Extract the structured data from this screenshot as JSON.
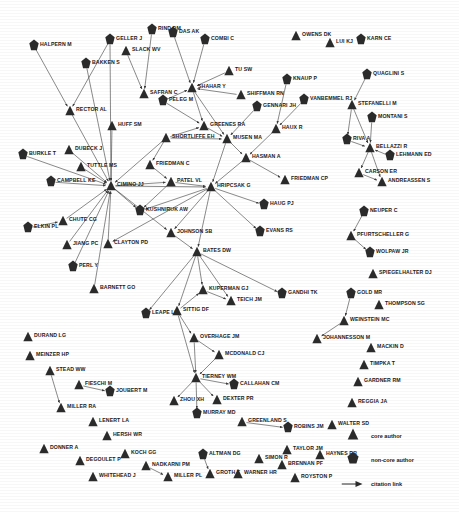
{
  "figure": {
    "type": "citation-network-diagram",
    "background": "#ffffff",
    "node_color": "#2b2b2b",
    "edge_color": "#3a3a3a",
    "label_color": "#1a1a1a"
  },
  "legend": {
    "items": [
      {
        "glyph": "triangle",
        "label": "core author",
        "icon_name": "triangle-core-author-icon"
      },
      {
        "glyph": "pentagon",
        "label": "non-core author",
        "icon_name": "pentagon-non-core-author-icon"
      },
      {
        "glyph": "arrow",
        "label": "citation link",
        "icon_name": "arrow-citation-link-icon"
      }
    ]
  },
  "chart_data": {
    "type": "scatter",
    "title": "",
    "xlabel": "",
    "ylabel": "",
    "grid": false,
    "legend_position": "bottom-right",
    "node_types": [
      "core",
      "non-core"
    ],
    "nodes": [
      {
        "id": "HALPERN M",
        "label": "HALPERN M",
        "type": "non-core",
        "x": 34,
        "y": 46
      },
      {
        "id": "BAKKEN S",
        "label": "BAKKEN S",
        "type": "non-core",
        "x": 86,
        "y": 64
      },
      {
        "id": "GELLER J",
        "label": "GELLER J",
        "type": "non-core",
        "x": 110,
        "y": 40
      },
      {
        "id": "SLACK WV",
        "label": "SLACK WV",
        "type": "core",
        "x": 126,
        "y": 51
      },
      {
        "id": "RIND DM",
        "label": "RIND DM",
        "type": "non-core",
        "x": 152,
        "y": 30
      },
      {
        "id": "DAS AK",
        "label": "DAS AK",
        "type": "non-core",
        "x": 173,
        "y": 33
      },
      {
        "id": "COMBI C",
        "label": "COMBI C",
        "type": "non-core",
        "x": 205,
        "y": 40
      },
      {
        "id": "OWENS DK",
        "label": "OWENS DK",
        "type": "core",
        "x": 296,
        "y": 36
      },
      {
        "id": "LUI KJ",
        "label": "LUI KJ",
        "type": "core",
        "x": 330,
        "y": 43
      },
      {
        "id": "KARN CE",
        "label": "KARN CE",
        "type": "non-core",
        "x": 361,
        "y": 40
      },
      {
        "id": "TU SW",
        "label": "TU SW",
        "type": "core",
        "x": 229,
        "y": 71
      },
      {
        "id": "KNAUP P",
        "label": "KNAUP P",
        "type": "non-core",
        "x": 287,
        "y": 80
      },
      {
        "id": "QUAGLINI S",
        "label": "QUAGLINI S",
        "type": "non-core",
        "x": 367,
        "y": 75
      },
      {
        "id": "SAFRAN C",
        "label": "SAFRAN C",
        "type": "core",
        "x": 144,
        "y": 94
      },
      {
        "id": "SHAHAR Y",
        "label": "SHAHAR Y",
        "type": "core",
        "x": 192,
        "y": 88
      },
      {
        "id": "SHIFFMAN RN",
        "label": "SHIFFMAN RN",
        "type": "core",
        "x": 241,
        "y": 95
      },
      {
        "id": "PELEG M",
        "label": "PELEG M",
        "type": "non-core",
        "x": 163,
        "y": 101
      },
      {
        "id": "GENNARI JH",
        "label": "GENNARI JH",
        "type": "non-core",
        "x": 257,
        "y": 107
      },
      {
        "id": "VANBEMMEL RJ",
        "label": "VANBEMMEL RJ",
        "type": "non-core",
        "x": 304,
        "y": 100
      },
      {
        "id": "STEFANELLI M",
        "label": "STEFANELLI M",
        "type": "core",
        "x": 352,
        "y": 105
      },
      {
        "id": "RECTOR AL",
        "label": "RECTOR AL",
        "type": "core",
        "x": 70,
        "y": 111
      },
      {
        "id": "HUFF SM",
        "label": "HUFF SM",
        "type": "core",
        "x": 112,
        "y": 126
      },
      {
        "id": "SHORTLIFFE EH",
        "label": "SHORTLIFFE EH",
        "type": "core",
        "x": 166,
        "y": 138
      },
      {
        "id": "GREENES RA",
        "label": "GREENES RA",
        "type": "core",
        "x": 204,
        "y": 126
      },
      {
        "id": "MUSEN MA",
        "label": "MUSEN MA",
        "type": "core",
        "x": 227,
        "y": 139
      },
      {
        "id": "HAUX R",
        "label": "HAUX R",
        "type": "core",
        "x": 276,
        "y": 129
      },
      {
        "id": "MONTANI S",
        "label": "MONTANI S",
        "type": "non-core",
        "x": 372,
        "y": 118
      },
      {
        "id": "RIVA A",
        "label": "RIVA A",
        "type": "non-core",
        "x": 347,
        "y": 140
      },
      {
        "id": "BELLAZZI R",
        "label": "BELLAZZI R",
        "type": "core",
        "x": 370,
        "y": 148
      },
      {
        "id": "LEHMANN ED",
        "label": "LEHMANN ED",
        "type": "non-core",
        "x": 390,
        "y": 156
      },
      {
        "id": "CARSON ER",
        "label": "CARSON ER",
        "type": "core",
        "x": 359,
        "y": 173
      },
      {
        "id": "ANDREASSEN S",
        "label": "ANDREASSEN S",
        "type": "core",
        "x": 382,
        "y": 182
      },
      {
        "id": "BURKLE T",
        "label": "BURKLE T",
        "type": "non-core",
        "x": 23,
        "y": 155
      },
      {
        "id": "DUBECK J",
        "label": "DUBECK J",
        "type": "core",
        "x": 69,
        "y": 150
      },
      {
        "id": "TUTTLE MS",
        "label": "TUTTLE MS",
        "type": "core",
        "x": 81,
        "y": 167
      },
      {
        "id": "HASMAN A",
        "label": "HASMAN A",
        "type": "core",
        "x": 246,
        "y": 158
      },
      {
        "id": "FRIEDMAN C",
        "label": "FRIEDMAN C",
        "type": "core",
        "x": 150,
        "y": 165
      },
      {
        "id": "CAMPBELL KE",
        "label": "CAMPBELL KE",
        "type": "non-core",
        "x": 51,
        "y": 182
      },
      {
        "id": "CIMINO JJ",
        "label": "CIMINO JJ",
        "type": "core",
        "x": 111,
        "y": 186
      },
      {
        "id": "PATEL VL",
        "label": "PATEL VL",
        "type": "core",
        "x": 171,
        "y": 182
      },
      {
        "id": "HRIPCSAK G",
        "label": "HRIPCSAK G",
        "type": "core",
        "x": 211,
        "y": 187
      },
      {
        "id": "FRIEDMAN CP",
        "label": "FRIEDMAN CP",
        "type": "core",
        "x": 285,
        "y": 180
      },
      {
        "id": "HAUG PJ",
        "label": "HAUG PJ",
        "type": "non-core",
        "x": 264,
        "y": 205
      },
      {
        "id": "NEUPER C",
        "label": "NEUPER C",
        "type": "non-core",
        "x": 364,
        "y": 212
      },
      {
        "id": "ELKIN PL",
        "label": "ELKIN PL",
        "type": "non-core",
        "x": 28,
        "y": 228
      },
      {
        "id": "CHUTE CG",
        "label": "CHUTE CG",
        "type": "core",
        "x": 63,
        "y": 221
      },
      {
        "id": "KUSHNIRUK AW",
        "label": "KUSHNIRUK AW",
        "type": "non-core",
        "x": 140,
        "y": 211
      },
      {
        "id": "JOHNSON SB",
        "label": "JOHNSON SB",
        "type": "core",
        "x": 171,
        "y": 233
      },
      {
        "id": "EVANS RS",
        "label": "EVANS RS",
        "type": "non-core",
        "x": 260,
        "y": 232
      },
      {
        "id": "PFURTSCHELLER G",
        "label": "PFURTSCHELLER G",
        "type": "core",
        "x": 351,
        "y": 236
      },
      {
        "id": "JIANG PC",
        "label": "JIANG PC",
        "type": "core",
        "x": 67,
        "y": 245
      },
      {
        "id": "CLAYTON PD",
        "label": "CLAYTON PD",
        "type": "core",
        "x": 108,
        "y": 244
      },
      {
        "id": "BATES DW",
        "label": "BATES DW",
        "type": "core",
        "x": 197,
        "y": 252
      },
      {
        "id": "WOLPAW JR",
        "label": "WOLPAW JR",
        "type": "non-core",
        "x": 370,
        "y": 253
      },
      {
        "id": "PERL Y",
        "label": "PERL Y",
        "type": "non-core",
        "x": 73,
        "y": 267
      },
      {
        "id": "SPIEGELHALTER DJ",
        "label": "SPIEGELHALTER DJ",
        "type": "core",
        "x": 373,
        "y": 274
      },
      {
        "id": "BARNETT GO",
        "label": "BARNETT GO",
        "type": "core",
        "x": 94,
        "y": 289
      },
      {
        "id": "KUPERMAN GJ",
        "label": "KUPERMAN GJ",
        "type": "core",
        "x": 203,
        "y": 290
      },
      {
        "id": "TEICH JM",
        "label": "TEICH JM",
        "type": "core",
        "x": 231,
        "y": 301
      },
      {
        "id": "GANDHI TK",
        "label": "GANDHI TK",
        "type": "non-core",
        "x": 282,
        "y": 294
      },
      {
        "id": "GOLD MR",
        "label": "GOLD MR",
        "type": "non-core",
        "x": 351,
        "y": 294
      },
      {
        "id": "THOMPSON SG",
        "label": "THOMPSON SG",
        "type": "core",
        "x": 379,
        "y": 305
      },
      {
        "id": "LEAPE LL",
        "label": "LEAPE LL",
        "type": "non-core",
        "x": 146,
        "y": 314
      },
      {
        "id": "SITTIG DF",
        "label": "SITTIG DF",
        "type": "core",
        "x": 177,
        "y": 311
      },
      {
        "id": "WEINSTEIN MC",
        "label": "WEINSTEIN MC",
        "type": "core",
        "x": 344,
        "y": 321
      },
      {
        "id": "DURAND LG",
        "label": "DURAND LG",
        "type": "core",
        "x": 28,
        "y": 337
      },
      {
        "id": "MEINZER HP",
        "label": "MEINZER HP",
        "type": "core",
        "x": 30,
        "y": 356
      },
      {
        "id": "OVERHAGE JM",
        "label": "OVERHAGE JM",
        "type": "core",
        "x": 194,
        "y": 338
      },
      {
        "id": "JOHANNESSON M",
        "label": "JOHANNESSON M",
        "type": "core",
        "x": 317,
        "y": 339
      },
      {
        "id": "MACKIN D",
        "label": "MACKIN D",
        "type": "core",
        "x": 371,
        "y": 348
      },
      {
        "id": "MCDONALD CJ",
        "label": "MCDONALD CJ",
        "type": "core",
        "x": 219,
        "y": 355
      },
      {
        "id": "TIMPKA T",
        "label": "TIMPKA T",
        "type": "core",
        "x": 364,
        "y": 365
      },
      {
        "id": "STEAD WW",
        "label": "STEAD WW",
        "type": "core",
        "x": 50,
        "y": 371
      },
      {
        "id": "FIESCHI M",
        "label": "FIESCHI M",
        "type": "core",
        "x": 79,
        "y": 385
      },
      {
        "id": "JOUBERT M",
        "label": "JOUBERT M",
        "type": "non-core",
        "x": 110,
        "y": 392
      },
      {
        "id": "TIERNEY WM",
        "label": "TIERNEY WM",
        "type": "core",
        "x": 196,
        "y": 378
      },
      {
        "id": "CALLAHAN CM",
        "label": "CALLAHAN CM",
        "type": "non-core",
        "x": 234,
        "y": 385
      },
      {
        "id": "GARDNER RM",
        "label": "GARDNER RM",
        "type": "core",
        "x": 358,
        "y": 382
      },
      {
        "id": "MILLER RA",
        "label": "MILLER RA",
        "type": "core",
        "x": 61,
        "y": 408
      },
      {
        "id": "ZHOU XH",
        "label": "ZHOU XH",
        "type": "core",
        "x": 174,
        "y": 401
      },
      {
        "id": "DEXTER PR",
        "label": "DEXTER PR",
        "type": "core",
        "x": 217,
        "y": 400
      },
      {
        "id": "MURRAY MD",
        "label": "MURRAY MD",
        "type": "non-core",
        "x": 197,
        "y": 414
      },
      {
        "id": "REGGIA JA",
        "label": "REGGIA JA",
        "type": "core",
        "x": 352,
        "y": 403
      },
      {
        "id": "LENERT LA",
        "label": "LENERT LA",
        "type": "core",
        "x": 93,
        "y": 422
      },
      {
        "id": "GREENLAND S",
        "label": "GREENLAND S",
        "type": "core",
        "x": 242,
        "y": 422
      },
      {
        "id": "ROBINS JM",
        "label": "ROBINS JM",
        "type": "non-core",
        "x": 288,
        "y": 428
      },
      {
        "id": "WALTER SD",
        "label": "WALTER SD",
        "type": "core",
        "x": 332,
        "y": 425
      },
      {
        "id": "HERSH WR",
        "label": "HERSH WR",
        "type": "core",
        "x": 107,
        "y": 436
      },
      {
        "id": "DONNER A",
        "label": "DONNER A",
        "type": "core",
        "x": 44,
        "y": 449
      },
      {
        "id": "DEGOULET P",
        "label": "DEGOULET P",
        "type": "core",
        "x": 80,
        "y": 461
      },
      {
        "id": "KOCH GG",
        "label": "KOCH GG",
        "type": "core",
        "x": 125,
        "y": 454
      },
      {
        "id": "NADKARNI PM",
        "label": "NADKARNI PM",
        "type": "core",
        "x": 146,
        "y": 466
      },
      {
        "id": "MILLER PL",
        "label": "MILLER PL",
        "type": "core",
        "x": 168,
        "y": 477
      },
      {
        "id": "WHITEHEAD J",
        "label": "WHITEHEAD J",
        "type": "core",
        "x": 93,
        "y": 477
      },
      {
        "id": "ALTMAN DG",
        "label": "ALTMAN DG",
        "type": "non-core",
        "x": 203,
        "y": 455
      },
      {
        "id": "GROTH T",
        "label": "GROTH T",
        "type": "core",
        "x": 210,
        "y": 474
      },
      {
        "id": "WARNER HR",
        "label": "WARNER HR",
        "type": "core",
        "x": 238,
        "y": 474
      },
      {
        "id": "SIMON R",
        "label": "SIMON R",
        "type": "core",
        "x": 259,
        "y": 459
      },
      {
        "id": "BRENNAN PF",
        "label": "BRENNAN PF",
        "type": "core",
        "x": 282,
        "y": 465
      },
      {
        "id": "ROYSTON P",
        "label": "ROYSTON P",
        "type": "core",
        "x": 295,
        "y": 478
      },
      {
        "id": "TAYLOR JM",
        "label": "TAYLOR JM",
        "type": "core",
        "x": 287,
        "y": 450
      },
      {
        "id": "HAYNES RB",
        "label": "HAYNES RB",
        "type": "core",
        "x": 320,
        "y": 455
      }
    ],
    "edges": [
      [
        "HALPERN M",
        "RECTOR AL"
      ],
      [
        "GELLER J",
        "RECTOR AL"
      ],
      [
        "BAKKEN S",
        "CIMINO JJ"
      ],
      [
        "GELLER J",
        "CIMINO JJ"
      ],
      [
        "SLACK WV",
        "SAFRAN C"
      ],
      [
        "RIND DM",
        "SAFRAN C"
      ],
      [
        "DAS AK",
        "SHAHAR Y"
      ],
      [
        "COMBI C",
        "SHAHAR Y"
      ],
      [
        "TU SW",
        "SHAHAR Y"
      ],
      [
        "SHIFFMAN RN",
        "SHAHAR Y"
      ],
      [
        "SHAHAR Y",
        "MUSEN MA"
      ],
      [
        "SHAHAR Y",
        "GREENES RA"
      ],
      [
        "PELEG M",
        "SHAHAR Y"
      ],
      [
        "PELEG M",
        "GREENES RA"
      ],
      [
        "GENNARI JH",
        "MUSEN MA"
      ],
      [
        "KNAUP P",
        "HAUX R"
      ],
      [
        "VANBEMMEL RJ",
        "HAUX R"
      ],
      [
        "QUAGLINI S",
        "STEFANELLI M"
      ],
      [
        "STEFANELLI M",
        "RIVA A"
      ],
      [
        "STEFANELLI M",
        "BELLAZZI R"
      ],
      [
        "MONTANI S",
        "BELLAZZI R"
      ],
      [
        "RIVA A",
        "BELLAZZI R"
      ],
      [
        "LEHMANN ED",
        "BELLAZZI R"
      ],
      [
        "BELLAZZI R",
        "CARSON ER"
      ],
      [
        "BELLAZZI R",
        "ANDREASSEN S"
      ],
      [
        "CARSON ER",
        "ANDREASSEN S"
      ],
      [
        "RECTOR AL",
        "CIMINO JJ"
      ],
      [
        "HUFF SM",
        "CIMINO JJ"
      ],
      [
        "DUBECK J",
        "CIMINO JJ"
      ],
      [
        "TUTTLE MS",
        "CIMINO JJ"
      ],
      [
        "BURKLE T",
        "CIMINO JJ"
      ],
      [
        "CAMPBELL KE",
        "CIMINO JJ"
      ],
      [
        "CHUTE CG",
        "CIMINO JJ"
      ],
      [
        "ELKIN PL",
        "CHUTE CG"
      ],
      [
        "JIANG PC",
        "CIMINO JJ"
      ],
      [
        "PERL Y",
        "CIMINO JJ"
      ],
      [
        "CLAYTON PD",
        "CIMINO JJ"
      ],
      [
        "BARNETT GO",
        "CIMINO JJ"
      ],
      [
        "CIMINO JJ",
        "PATEL VL"
      ],
      [
        "CIMINO JJ",
        "HRIPCSAK G"
      ],
      [
        "CIMINO JJ",
        "JOHNSON SB"
      ],
      [
        "CIMINO JJ",
        "KUSHNIRUK AW"
      ],
      [
        "SHORTLIFFE EH",
        "CIMINO JJ"
      ],
      [
        "SHORTLIFFE EH",
        "MUSEN MA"
      ],
      [
        "SHORTLIFFE EH",
        "GREENES RA"
      ],
      [
        "SHORTLIFFE EH",
        "FRIEDMAN C"
      ],
      [
        "FRIEDMAN C",
        "PATEL VL"
      ],
      [
        "PATEL VL",
        "HRIPCSAK G"
      ],
      [
        "PATEL VL",
        "KUSHNIRUK AW"
      ],
      [
        "GREENES RA",
        "MUSEN MA"
      ],
      [
        "MUSEN MA",
        "HRIPCSAK G"
      ],
      [
        "MUSEN MA",
        "HASMAN A"
      ],
      [
        "HASMAN A",
        "HRIPCSAK G"
      ],
      [
        "HASMAN A",
        "FRIEDMAN CP"
      ],
      [
        "HAUX R",
        "HASMAN A"
      ],
      [
        "HRIPCSAK G",
        "HAUG PJ"
      ],
      [
        "HRIPCSAK G",
        "EVANS RS"
      ],
      [
        "HRIPCSAK G",
        "JOHNSON SB"
      ],
      [
        "HRIPCSAK G",
        "BATES DW"
      ],
      [
        "HRIPCSAK G",
        "CLAYTON PD"
      ],
      [
        "HRIPCSAK G",
        "KUSHNIRUK AW"
      ],
      [
        "JOHNSON SB",
        "BATES DW"
      ],
      [
        "BATES DW",
        "KUPERMAN GJ"
      ],
      [
        "BATES DW",
        "TEICH JM"
      ],
      [
        "BATES DW",
        "GANDHI TK"
      ],
      [
        "BATES DW",
        "LEAPE LL"
      ],
      [
        "BATES DW",
        "SITTIG DF"
      ],
      [
        "KUPERMAN GJ",
        "TEICH JM"
      ],
      [
        "SITTIG DF",
        "KUPERMAN GJ"
      ],
      [
        "SITTIG DF",
        "OVERHAGE JM"
      ],
      [
        "OVERHAGE JM",
        "MCDONALD CJ"
      ],
      [
        "OVERHAGE JM",
        "TIERNEY WM"
      ],
      [
        "MCDONALD CJ",
        "TIERNEY WM"
      ],
      [
        "TIERNEY WM",
        "CALLAHAN CM"
      ],
      [
        "TIERNEY WM",
        "ZHOU XH"
      ],
      [
        "TIERNEY WM",
        "DEXTER PR"
      ],
      [
        "TIERNEY WM",
        "MURRAY MD"
      ],
      [
        "SITTIG DF",
        "TIERNEY WM"
      ],
      [
        "NEUPER C",
        "PFURTSCHELLER G"
      ],
      [
        "PFURTSCHELLER G",
        "WOLPAW JR"
      ],
      [
        "GOLD MR",
        "WEINSTEIN MC"
      ],
      [
        "WEINSTEIN MC",
        "JOHANNESSON M"
      ],
      [
        "STEAD WW",
        "MILLER RA"
      ],
      [
        "FIESCHI M",
        "JOUBERT M"
      ],
      [
        "NADKARNI PM",
        "MILLER PL"
      ],
      [
        "ALTMAN DG",
        "GROTH T"
      ],
      [
        "GREENLAND S",
        "ROBINS JM"
      ]
    ]
  }
}
